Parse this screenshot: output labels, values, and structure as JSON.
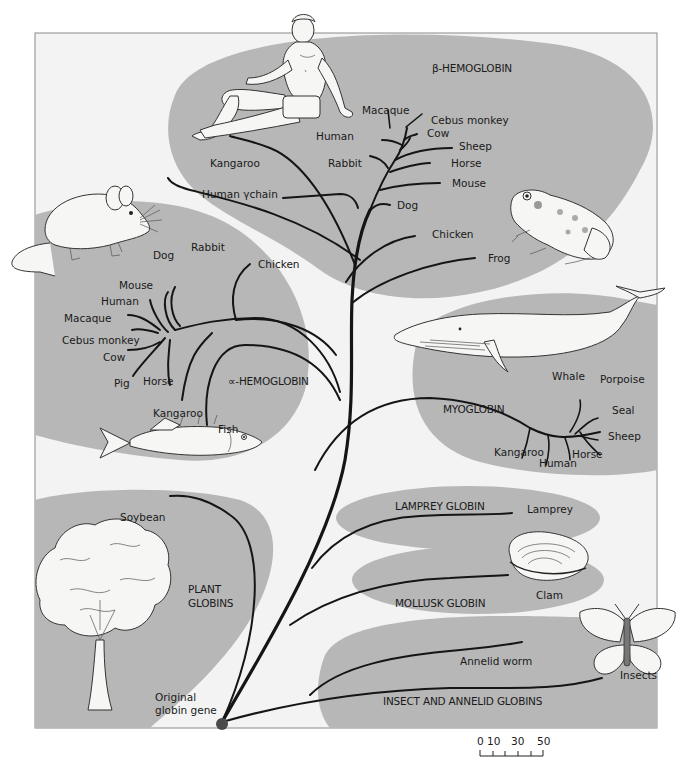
{
  "figure": {
    "colors": {
      "background": "#ffffff",
      "panel": "#f3f3f3",
      "region": "#b7b7b7",
      "branch": "#151515",
      "root_node": "#4a4a4a"
    }
  },
  "groups": {
    "beta_hemoglobin": "β-HEMOGLOBIN",
    "alpha_hemoglobin": "∝-HEMOGLOBIN",
    "myoglobin": "MYOGLOBIN",
    "lamprey_globin": "LAMPREY GLOBIN",
    "mollusk_globin": "MOLLUSK GLOBIN",
    "insect_annelid_globins": "INSECT AND ANNELID GLOBINS",
    "plant_globins_line1": "PLANT",
    "plant_globins_line2": "GLOBINS"
  },
  "beta_leaves": {
    "human": "Human",
    "macaque": "Macaque",
    "cebus": "Cebus monkey",
    "cow": "Cow",
    "sheep": "Sheep",
    "horse": "Horse",
    "mouse": "Mouse",
    "rabbit": "Rabbit",
    "kangaroo": "Kangaroo",
    "human_gamma": "Human γchain",
    "dog": "Dog",
    "chicken": "Chicken",
    "frog": "Frog"
  },
  "alpha_leaves": {
    "dog": "Dog",
    "rabbit": "Rabbit",
    "chicken": "Chicken",
    "mouse": "Mouse",
    "human": "Human",
    "macaque": "Macaque",
    "cebus": "Cebus monkey",
    "cow": "Cow",
    "pig": "Pig",
    "horse": "Horse",
    "kangaroo": "Kangaroo",
    "fish": "Fish"
  },
  "myoglobin_leaves": {
    "whale": "Whale",
    "porpoise": "Porpoise",
    "seal": "Seal",
    "sheep": "Sheep",
    "horse": "Horse",
    "human": "Human",
    "kangaroo": "Kangaroo"
  },
  "other_leaves": {
    "lamprey": "Lamprey",
    "clam": "Clam",
    "annelid_worm": "Annelid worm",
    "insects": "Insects",
    "soybean": "Soybean",
    "root_line1": "Original",
    "root_line2": "globin gene"
  },
  "scale_bar": {
    "labels": [
      "0",
      "10",
      "30",
      "50"
    ],
    "ticks": 6
  },
  "illustrations": {
    "human": "human-figure",
    "mouse": "mouse",
    "frog": "frog",
    "whale": "whale",
    "fish": "fish",
    "tree": "tree",
    "clam": "clam",
    "butterfly": "butterfly"
  }
}
